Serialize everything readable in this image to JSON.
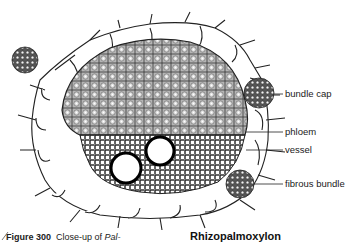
{
  "figure": {
    "labels": [
      {
        "id": "bundle-cap",
        "text": "bundle cap"
      },
      {
        "id": "phloem",
        "text": "phloem"
      },
      {
        "id": "vessel",
        "text": "vessel"
      },
      {
        "id": "fibrous-bundle",
        "text": "fibrous bundle"
      }
    ]
  },
  "caption": {
    "figure_number": "Figure 300",
    "text_prefix": "Close-up of ",
    "text_italic": "Pal-",
    "genus_heading": "Rhizopalmoxylon"
  },
  "colors": {
    "ink": "#1a1a1a",
    "tissue_shading": "#8a8a8a",
    "background": "#ffffff"
  }
}
